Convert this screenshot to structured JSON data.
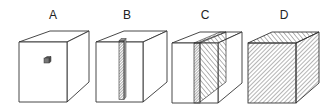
{
  "figure": {
    "panels": [
      {
        "label": "A",
        "description": "cube with small cubic sample"
      },
      {
        "label": "B",
        "description": "cube with thin vertical column sample"
      },
      {
        "label": "C",
        "description": "cube with vertical slab/plane sample"
      },
      {
        "label": "D",
        "description": "fully hatched cube (whole volume)"
      }
    ]
  },
  "colors": {
    "stroke": "#333333",
    "hatch": "#444444",
    "background": "#ffffff"
  }
}
